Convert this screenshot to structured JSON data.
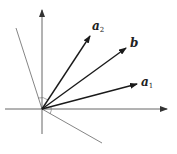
{
  "diagram": {
    "origin": [
      42,
      109
    ],
    "axes": {
      "x": {
        "from": [
          5,
          109
        ],
        "to": [
          167,
          109
        ]
      },
      "y": {
        "from": [
          42,
          134
        ],
        "to": [
          42,
          10
        ]
      }
    },
    "vectors": [
      {
        "name": "a2",
        "label": "a",
        "subscript": "2",
        "tip": [
          90,
          36
        ],
        "label_pos": [
          92,
          30
        ]
      },
      {
        "name": "b",
        "label": "b",
        "subscript": "",
        "tip": [
          126,
          48
        ],
        "label_pos": [
          130,
          47
        ]
      },
      {
        "name": "a1",
        "label": "a",
        "subscript": "1",
        "tip": [
          137,
          84
        ],
        "label_pos": [
          141,
          86
        ]
      }
    ],
    "lines": [
      {
        "name": "normal-line-upper",
        "from": [
          16,
          28
        ],
        "to": [
          42,
          109
        ]
      },
      {
        "name": "normal-line-lower",
        "from": [
          42,
          109
        ],
        "to": [
          102,
          143
        ]
      }
    ],
    "colors": {
      "vector": "#1a1a1a",
      "axis": "#555555",
      "line": "#777777"
    }
  }
}
